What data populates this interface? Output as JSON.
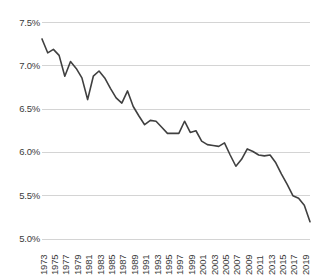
{
  "chart_data": {
    "type": "line",
    "title": "",
    "subtitle": "",
    "xlabel": "",
    "ylabel": "",
    "ylim": [
      5.0,
      7.5
    ],
    "xlim": [
      1973,
      2020
    ],
    "grid": true,
    "grid_axis": "y",
    "legend": false,
    "legend_position": "none",
    "y_tick_labels": [
      "7.5%",
      "7.0%",
      "6.5%",
      "6.0%",
      "5.5%",
      "5.0%"
    ],
    "y_tick_values": [
      7.5,
      7.0,
      6.5,
      6.0,
      5.5,
      5.0
    ],
    "x_tick_labels": [
      "1973",
      "1975",
      "1977",
      "1979",
      "1981",
      "1983",
      "1985",
      "1987",
      "1989",
      "1991",
      "1993",
      "1995",
      "1997",
      "1999",
      "2001",
      "2003",
      "2005",
      "2007",
      "2009",
      "2011",
      "2013",
      "2015",
      "2017",
      "2019"
    ],
    "x_tick_values": [
      1973,
      1975,
      1977,
      1979,
      1981,
      1983,
      1985,
      1987,
      1989,
      1991,
      1993,
      1995,
      1997,
      1999,
      2001,
      2003,
      2005,
      2007,
      2009,
      2011,
      2013,
      2015,
      2017,
      2019
    ],
    "series": [
      {
        "name": "value",
        "color": "#404040",
        "line_width": 1.6,
        "x": [
          1973,
          1974,
          1975,
          1976,
          1977,
          1978,
          1979,
          1980,
          1981,
          1982,
          1983,
          1984,
          1985,
          1986,
          1987,
          1988,
          1989,
          1990,
          1991,
          1992,
          1993,
          1994,
          1995,
          1996,
          1997,
          1998,
          1999,
          2000,
          2001,
          2002,
          2003,
          2004,
          2005,
          2006,
          2007,
          2008,
          2009,
          2010,
          2011,
          2012,
          2013,
          2014,
          2015,
          2016,
          2017,
          2018,
          2019,
          2020
        ],
        "y": [
          7.31,
          7.15,
          7.19,
          7.12,
          6.88,
          7.05,
          6.97,
          6.86,
          6.61,
          6.88,
          6.94,
          6.86,
          6.74,
          6.63,
          6.57,
          6.71,
          6.53,
          6.42,
          6.32,
          6.37,
          6.36,
          6.29,
          6.22,
          6.22,
          6.22,
          6.36,
          6.23,
          6.25,
          6.13,
          6.09,
          6.08,
          6.07,
          6.11,
          5.97,
          5.84,
          5.92,
          6.04,
          6.01,
          5.97,
          5.96,
          5.97,
          5.88,
          5.75,
          5.63,
          5.5,
          5.47,
          5.39,
          5.2
        ]
      }
    ]
  },
  "axes": {
    "y_axis_name": "percent-axis",
    "x_axis_name": "year-axis"
  },
  "colors": {
    "line": "#404040",
    "grid": "#d4d4d4",
    "tick_text": "#3b3b3b",
    "background": "#ffffff"
  }
}
